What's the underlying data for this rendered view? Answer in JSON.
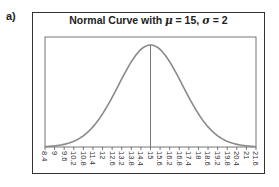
{
  "panel_label": "a)",
  "title_parts": {
    "prefix": "Normal Curve with ",
    "mu_symbol": "μ",
    "mu_text": " = 15, ",
    "sigma_symbol": "σ",
    "sigma_text": " = 2"
  },
  "chart_data": {
    "type": "line",
    "title": "Normal Curve with μ = 15, σ = 2",
    "distribution": "normal",
    "mean": 15,
    "sd": 2,
    "xlabel": "",
    "ylabel": "",
    "xlim": [
      8.4,
      21.6
    ],
    "x_ticks": [
      "8.4",
      "9",
      "9.6",
      "10.2",
      "10.8",
      "11.4",
      "12",
      "12.6",
      "13.2",
      "13.8",
      "14.4",
      "15",
      "15.6",
      "16.2",
      "16.8",
      "17.4",
      "18",
      "18.6",
      "19.2",
      "19.8",
      "20.4",
      "21",
      "21.6"
    ],
    "mean_line": 15,
    "grid": false,
    "legend": null,
    "colors": {
      "curve": "#8a8a8a",
      "frame": "#333333",
      "axis": "#555555"
    }
  }
}
